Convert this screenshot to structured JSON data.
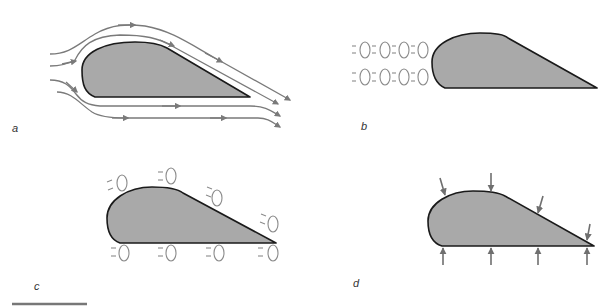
{
  "figure": {
    "colors": {
      "airfoil_fill": "#a9a9a9",
      "airfoil_outline": "#1a1a1a",
      "streamline": "#7a7a7a",
      "molecule": "#8a8a8a",
      "force_arrow": "#6f6f6f",
      "scale_bar": "#777777"
    },
    "panels": [
      {
        "id": "a",
        "label": "a",
        "content": "Airfoil with streamlines flowing around it (two above, three below), each with direction arrowheads",
        "streamline_count": 5
      },
      {
        "id": "b",
        "label": "b",
        "content": "Airfoil with two rows of air molecules approaching its leading edge",
        "molecule_rows": 2,
        "molecules_per_row": 4
      },
      {
        "id": "c",
        "label": "c",
        "content": "Airfoil with molecules distributed along upper and lower surfaces",
        "molecules_top": 4,
        "molecules_bottom": 4
      },
      {
        "id": "d",
        "label": "d",
        "content": "Airfoil with pressure arrows pointing inward on upper and lower surfaces",
        "arrows_top": 4,
        "arrows_bottom": 4
      }
    ],
    "scale_bar": {
      "visible": true
    }
  }
}
